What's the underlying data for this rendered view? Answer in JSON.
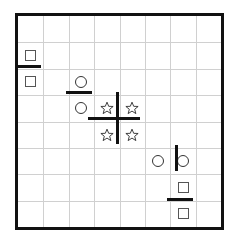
{
  "board": {
    "title": "grid-puzzle-board",
    "grid": {
      "columns": 8,
      "rows": 8,
      "cell_width": 25.4,
      "cell_height": 26.4,
      "origin_x": 15,
      "origin_y": 13,
      "border_color": "#111111",
      "gridline_color": "#d0d0d0",
      "background_color": "#ffffff",
      "border_width": 3,
      "grid_on": true
    },
    "pieces": [
      {
        "id": "square-r1c0",
        "shape": "square",
        "row": 1,
        "col": 0,
        "label": "square"
      },
      {
        "id": "square-r2c0",
        "shape": "square",
        "row": 2,
        "col": 0,
        "label": "square"
      },
      {
        "id": "circle-r2c2",
        "shape": "circle",
        "row": 2,
        "col": 2,
        "label": "circle"
      },
      {
        "id": "circle-r3c2",
        "shape": "circle",
        "row": 3,
        "col": 2,
        "label": "circle"
      },
      {
        "id": "star-r3c3",
        "shape": "star",
        "row": 3,
        "col": 3,
        "label": "star"
      },
      {
        "id": "star-r3c4",
        "shape": "star",
        "row": 3,
        "col": 4,
        "label": "star"
      },
      {
        "id": "star-r4c3",
        "shape": "star",
        "row": 4,
        "col": 3,
        "label": "star"
      },
      {
        "id": "star-r4c4",
        "shape": "star",
        "row": 4,
        "col": 4,
        "label": "star"
      },
      {
        "id": "circle-r5c5",
        "shape": "circle",
        "row": 5,
        "col": 5,
        "label": "circle"
      },
      {
        "id": "circle-r5c6",
        "shape": "circle",
        "row": 5,
        "col": 6,
        "label": "circle"
      },
      {
        "id": "square-r6c6",
        "shape": "square",
        "row": 6,
        "col": 6,
        "label": "square"
      },
      {
        "id": "square-r7c6",
        "shape": "square",
        "row": 7,
        "col": 6,
        "label": "square"
      }
    ],
    "bars": [
      {
        "id": "bar-top-left-horizontal",
        "orientation": "horizontal",
        "x": 15,
        "y": 65,
        "length": 26,
        "thickness": 3,
        "color": "#111111"
      },
      {
        "id": "bar-upper-middle-horizontal",
        "orientation": "horizontal",
        "x": 66,
        "y": 91,
        "length": 26,
        "thickness": 3,
        "color": "#111111"
      },
      {
        "id": "bar-center-horizontal",
        "orientation": "horizontal",
        "x": 88,
        "y": 117,
        "length": 52,
        "thickness": 3,
        "color": "#111111"
      },
      {
        "id": "bar-center-vertical",
        "orientation": "vertical",
        "x": 116,
        "y": 92,
        "length": 52,
        "thickness": 3,
        "color": "#111111"
      },
      {
        "id": "bar-lower-right-vertical",
        "orientation": "vertical",
        "x": 175,
        "y": 145,
        "length": 26,
        "thickness": 3,
        "color": "#111111"
      },
      {
        "id": "bar-bottom-right-horizontal",
        "orientation": "horizontal",
        "x": 167,
        "y": 198,
        "length": 26,
        "thickness": 3,
        "color": "#111111"
      }
    ],
    "star_color": "#333333",
    "square_color": "#555555",
    "circle_color": "#333333"
  }
}
